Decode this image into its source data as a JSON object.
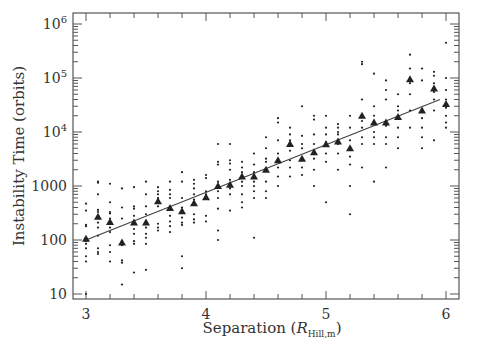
{
  "chart_data": {
    "type": "scatter",
    "title": "",
    "xlabel": "Separation (R",
    "xlabel_sub": "Hill,m",
    "xlabel_close": ")",
    "ylabel": "Instability Time (orbits)",
    "xscale": "linear",
    "yscale": "log",
    "xlim": [
      2.93,
      6.07
    ],
    "ylim": [
      8,
      1500000
    ],
    "xticks": [
      3,
      4,
      5,
      6
    ],
    "xtick_labels": [
      "3",
      "4",
      "5",
      "6"
    ],
    "yticks": [
      10,
      100,
      1000,
      10000,
      100000,
      1000000
    ],
    "ytick_labels": [
      "10",
      "100",
      "1000",
      "10^4",
      "10^5",
      "10^6"
    ],
    "grid": false,
    "legend": null,
    "series": [
      {
        "name": "median",
        "marker": "triangle",
        "x": [
          3.0,
          3.1,
          3.2,
          3.3,
          3.4,
          3.5,
          3.6,
          3.7,
          3.8,
          3.9,
          4.0,
          4.1,
          4.2,
          4.3,
          4.4,
          4.5,
          4.6,
          4.7,
          4.8,
          4.9,
          5.0,
          5.1,
          5.2,
          5.3,
          5.4,
          5.5,
          5.6,
          5.7,
          5.8,
          5.9,
          6.0
        ],
        "y": [
          105,
          270,
          215,
          90,
          210,
          210,
          520,
          390,
          340,
          480,
          620,
          1000,
          1060,
          1500,
          1500,
          2000,
          3000,
          6000,
          3200,
          4200,
          5900,
          6700,
          5000,
          20000,
          15000,
          15000,
          19000,
          95000,
          25000,
          64000,
          33000
        ]
      },
      {
        "name": "runs",
        "marker": "dot",
        "points": [
          [
            3.0,
            10
          ],
          [
            3.0,
            40
          ],
          [
            3.0,
            50
          ],
          [
            3.0,
            70
          ],
          [
            3.0,
            85
          ],
          [
            3.0,
            95
          ],
          [
            3.0,
            180
          ],
          [
            3.0,
            190
          ],
          [
            3.0,
            350
          ],
          [
            3.0,
            470
          ],
          [
            3.1,
            55
          ],
          [
            3.1,
            60
          ],
          [
            3.1,
            70
          ],
          [
            3.1,
            120
          ],
          [
            3.1,
            170
          ],
          [
            3.1,
            210
          ],
          [
            3.1,
            330
          ],
          [
            3.1,
            360
          ],
          [
            3.1,
            700
          ],
          [
            3.1,
            1150
          ],
          [
            3.1,
            1200
          ],
          [
            3.2,
            40
          ],
          [
            3.2,
            60
          ],
          [
            3.2,
            80
          ],
          [
            3.2,
            140
          ],
          [
            3.2,
            170
          ],
          [
            3.2,
            250
          ],
          [
            3.2,
            310
          ],
          [
            3.2,
            330
          ],
          [
            3.2,
            500
          ],
          [
            3.2,
            1100
          ],
          [
            3.3,
            15
          ],
          [
            3.3,
            38
          ],
          [
            3.3,
            42
          ],
          [
            3.3,
            80
          ],
          [
            3.3,
            95
          ],
          [
            3.3,
            250
          ],
          [
            3.3,
            400
          ],
          [
            3.3,
            900
          ],
          [
            3.4,
            25
          ],
          [
            3.4,
            85
          ],
          [
            3.4,
            95
          ],
          [
            3.4,
            130
          ],
          [
            3.4,
            160
          ],
          [
            3.4,
            280
          ],
          [
            3.4,
            380
          ],
          [
            3.4,
            420
          ],
          [
            3.4,
            950
          ],
          [
            3.5,
            28
          ],
          [
            3.5,
            85
          ],
          [
            3.5,
            110
          ],
          [
            3.5,
            130
          ],
          [
            3.5,
            170
          ],
          [
            3.5,
            300
          ],
          [
            3.5,
            420
          ],
          [
            3.5,
            700
          ],
          [
            3.5,
            1200
          ],
          [
            3.6,
            150
          ],
          [
            3.6,
            170
          ],
          [
            3.6,
            200
          ],
          [
            3.6,
            420
          ],
          [
            3.6,
            600
          ],
          [
            3.6,
            700
          ],
          [
            3.6,
            800
          ],
          [
            3.6,
            950
          ],
          [
            3.7,
            140
          ],
          [
            3.7,
            180
          ],
          [
            3.7,
            220
          ],
          [
            3.7,
            280
          ],
          [
            3.7,
            600
          ],
          [
            3.7,
            700
          ],
          [
            3.7,
            850
          ],
          [
            3.7,
            1200
          ],
          [
            3.8,
            30
          ],
          [
            3.8,
            50
          ],
          [
            3.8,
            190
          ],
          [
            3.8,
            210
          ],
          [
            3.8,
            260
          ],
          [
            3.8,
            400
          ],
          [
            3.8,
            600
          ],
          [
            3.8,
            1200
          ],
          [
            3.8,
            1800
          ],
          [
            3.9,
            210
          ],
          [
            3.9,
            240
          ],
          [
            3.9,
            300
          ],
          [
            3.9,
            560
          ],
          [
            3.9,
            700
          ],
          [
            3.9,
            900
          ],
          [
            3.9,
            1100
          ],
          [
            3.9,
            1300
          ],
          [
            4.0,
            220
          ],
          [
            4.0,
            280
          ],
          [
            4.0,
            600
          ],
          [
            4.0,
            700
          ],
          [
            4.0,
            800
          ],
          [
            4.0,
            1400
          ],
          [
            4.0,
            1600
          ],
          [
            4.1,
            100
          ],
          [
            4.1,
            150
          ],
          [
            4.1,
            380
          ],
          [
            4.1,
            600
          ],
          [
            4.1,
            800
          ],
          [
            4.1,
            1200
          ],
          [
            4.1,
            2500
          ],
          [
            4.1,
            2800
          ],
          [
            4.1,
            6000
          ],
          [
            4.2,
            350
          ],
          [
            4.2,
            700
          ],
          [
            4.2,
            900
          ],
          [
            4.2,
            1300
          ],
          [
            4.2,
            2000
          ],
          [
            4.2,
            2600
          ],
          [
            4.2,
            3000
          ],
          [
            4.2,
            6000
          ],
          [
            4.3,
            400
          ],
          [
            4.3,
            500
          ],
          [
            4.3,
            700
          ],
          [
            4.3,
            1000
          ],
          [
            4.3,
            1200
          ],
          [
            4.3,
            1800
          ],
          [
            4.3,
            2200
          ],
          [
            4.3,
            2800
          ],
          [
            4.4,
            110
          ],
          [
            4.4,
            600
          ],
          [
            4.4,
            800
          ],
          [
            4.4,
            1000
          ],
          [
            4.4,
            1200
          ],
          [
            4.4,
            1800
          ],
          [
            4.4,
            2500
          ],
          [
            4.4,
            4000
          ],
          [
            4.5,
            600
          ],
          [
            4.5,
            800
          ],
          [
            4.5,
            1200
          ],
          [
            4.5,
            2800
          ],
          [
            4.5,
            3200
          ],
          [
            4.5,
            5000
          ],
          [
            4.5,
            8000
          ],
          [
            4.6,
            1000
          ],
          [
            4.6,
            1500
          ],
          [
            4.6,
            2200
          ],
          [
            4.6,
            3000
          ],
          [
            4.6,
            4000
          ],
          [
            4.6,
            7000
          ],
          [
            4.6,
            15000
          ],
          [
            4.6,
            18000
          ],
          [
            4.7,
            1500
          ],
          [
            4.7,
            2200
          ],
          [
            4.7,
            3000
          ],
          [
            4.7,
            4500
          ],
          [
            4.7,
            7000
          ],
          [
            4.7,
            9000
          ],
          [
            4.7,
            12000
          ],
          [
            4.8,
            1600
          ],
          [
            4.8,
            2200
          ],
          [
            4.8,
            3000
          ],
          [
            4.8,
            5000
          ],
          [
            4.8,
            6000
          ],
          [
            4.8,
            8500
          ],
          [
            4.8,
            30000
          ],
          [
            4.9,
            1000
          ],
          [
            4.9,
            2000
          ],
          [
            4.9,
            3200
          ],
          [
            4.9,
            4000
          ],
          [
            4.9,
            6000
          ],
          [
            4.9,
            9000
          ],
          [
            4.9,
            17000
          ],
          [
            4.9,
            20000
          ],
          [
            5.0,
            500
          ],
          [
            5.0,
            2800
          ],
          [
            5.0,
            4000
          ],
          [
            5.0,
            6500
          ],
          [
            5.0,
            9000
          ],
          [
            5.0,
            12000
          ],
          [
            5.0,
            20000
          ],
          [
            5.1,
            2000
          ],
          [
            5.1,
            4000
          ],
          [
            5.1,
            6000
          ],
          [
            5.1,
            9000
          ],
          [
            5.1,
            12000
          ],
          [
            5.1,
            14000
          ],
          [
            5.1,
            10000
          ],
          [
            5.2,
            300
          ],
          [
            5.2,
            1000
          ],
          [
            5.2,
            2500
          ],
          [
            5.2,
            3500
          ],
          [
            5.2,
            7000
          ],
          [
            5.2,
            12000
          ],
          [
            5.2,
            20000
          ],
          [
            5.3,
            2200
          ],
          [
            5.3,
            6000
          ],
          [
            5.3,
            8000
          ],
          [
            5.3,
            12000
          ],
          [
            5.3,
            16000
          ],
          [
            5.3,
            40000
          ],
          [
            5.3,
            180000
          ],
          [
            5.3,
            200000
          ],
          [
            5.4,
            1200
          ],
          [
            5.4,
            6000
          ],
          [
            5.4,
            8000
          ],
          [
            5.4,
            10000
          ],
          [
            5.4,
            20000
          ],
          [
            5.4,
            30000
          ],
          [
            5.4,
            120000
          ],
          [
            5.5,
            2200
          ],
          [
            5.5,
            6000
          ],
          [
            5.5,
            8000
          ],
          [
            5.5,
            13000
          ],
          [
            5.5,
            40000
          ],
          [
            5.5,
            60000
          ],
          [
            5.5,
            90000
          ],
          [
            5.6,
            5000
          ],
          [
            5.6,
            8000
          ],
          [
            5.6,
            12000
          ],
          [
            5.6,
            25000
          ],
          [
            5.6,
            30000
          ],
          [
            5.6,
            50000
          ],
          [
            5.7,
            12000
          ],
          [
            5.7,
            25000
          ],
          [
            5.7,
            50000
          ],
          [
            5.7,
            80000
          ],
          [
            5.7,
            150000
          ],
          [
            5.7,
            270000
          ],
          [
            5.8,
            5000
          ],
          [
            5.8,
            8000
          ],
          [
            5.8,
            12000
          ],
          [
            5.8,
            18000
          ],
          [
            5.8,
            90000
          ],
          [
            5.8,
            150000
          ],
          [
            5.9,
            7000
          ],
          [
            5.9,
            25000
          ],
          [
            5.9,
            40000
          ],
          [
            5.9,
            55000
          ],
          [
            5.9,
            80000
          ],
          [
            5.9,
            110000
          ],
          [
            5.9,
            130000
          ],
          [
            6.0,
            12000
          ],
          [
            6.0,
            15000
          ],
          [
            6.0,
            20000
          ],
          [
            6.0,
            28000
          ],
          [
            6.0,
            40000
          ],
          [
            6.0,
            60000
          ],
          [
            6.0,
            100000
          ],
          [
            6.0,
            450000
          ]
        ]
      },
      {
        "name": "fit",
        "type": "line",
        "x": [
          3.0,
          5.95
        ],
        "y": [
          100,
          40000
        ]
      }
    ]
  },
  "colors": {
    "axis": "#555555",
    "marker": "#222222",
    "fit_line": "#444444",
    "text": "#333333",
    "background": "#ffffff"
  }
}
